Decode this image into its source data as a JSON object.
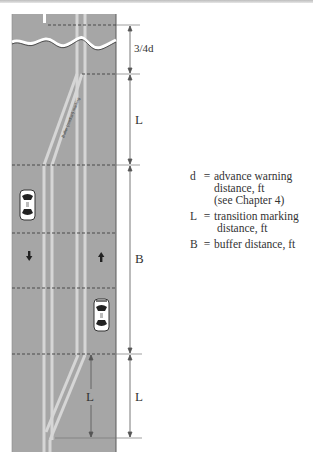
{
  "figure": {
    "road_label": "Buffer (median) marking",
    "dimensions": {
      "top": "3/4d",
      "upper_L": "L",
      "buffer": "B",
      "lower_L_outer": "L",
      "lower_L_inner": "L"
    },
    "legend": [
      {
        "symbol": "d",
        "equals": "=",
        "line1": "advance warning",
        "line2": "distance, ft",
        "line3": "(see Chapter 4)"
      },
      {
        "symbol": "L",
        "equals": "=",
        "line1": "transition marking",
        "line2": "distance, ft"
      },
      {
        "symbol": "B",
        "equals": "=",
        "line1": "buffer distance, ft"
      }
    ],
    "colors": {
      "road": "#a6a6a6",
      "marking": "#d9d9d9",
      "dashed_line": "#4a4a4a",
      "dimension_line": "#555555",
      "text": "#333333"
    },
    "vehicles": [
      {
        "label": "car-southbound"
      },
      {
        "label": "car-northbound"
      }
    ],
    "arrows": [
      {
        "direction": "down"
      },
      {
        "direction": "up"
      }
    ]
  }
}
